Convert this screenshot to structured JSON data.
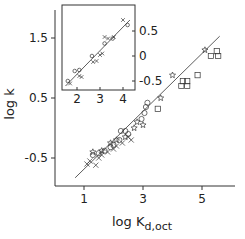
{
  "chart_data": [
    {
      "name": "main",
      "type": "scatter",
      "title": "",
      "xlabel": "log K",
      "xlabel_sub": "d,oct",
      "ylabel": "log k",
      "xlim": [
        0,
        6
      ],
      "ylim": [
        -1.0,
        2.0
      ],
      "xticks": [
        1,
        3,
        5
      ],
      "xtick_labels": [
        "1",
        "3",
        "5"
      ],
      "yticks": [
        1.5,
        0.5,
        -0.5
      ],
      "ytick_labels": [
        "1.5",
        "0.5",
        "-0.5"
      ],
      "grid": false,
      "fit_line": {
        "x": [
          0.7,
          5.6
        ],
        "y": [
          -0.83,
          1.53
        ]
      },
      "series": [
        {
          "name": "circles",
          "marker": "circle",
          "points": [
            [
              1.3,
              -0.45
            ],
            [
              1.5,
              -0.42
            ],
            [
              1.7,
              -0.38
            ],
            [
              1.9,
              -0.32
            ],
            [
              2.0,
              -0.28
            ],
            [
              2.2,
              -0.2
            ],
            [
              2.25,
              -0.05
            ],
            [
              2.4,
              -0.05
            ],
            [
              2.5,
              -0.1
            ],
            [
              2.95,
              0.15
            ],
            [
              3.05,
              0.25
            ],
            [
              3.1,
              0.35
            ],
            [
              3.15,
              0.42
            ]
          ]
        },
        {
          "name": "crosses",
          "marker": "cross",
          "points": [
            [
              1.1,
              -0.6
            ],
            [
              1.2,
              -0.55
            ],
            [
              1.4,
              -0.62
            ],
            [
              1.5,
              -0.5
            ],
            [
              1.6,
              -0.45
            ],
            [
              1.8,
              -0.4
            ],
            [
              2.0,
              -0.35
            ],
            [
              2.1,
              -0.3
            ],
            [
              2.3,
              -0.25
            ],
            [
              2.5,
              -0.15
            ],
            [
              2.6,
              -0.2
            ]
          ]
        },
        {
          "name": "stars",
          "marker": "star",
          "points": [
            [
              1.3,
              -0.4
            ],
            [
              1.6,
              -0.38
            ],
            [
              1.9,
              -0.25
            ],
            [
              2.1,
              -0.2
            ],
            [
              2.4,
              -0.15
            ],
            [
              2.7,
              0.0
            ],
            [
              2.8,
              0.1
            ],
            [
              3.0,
              0.05
            ],
            [
              3.6,
              0.5
            ],
            [
              4.0,
              0.88
            ],
            [
              5.1,
              1.3
            ]
          ]
        },
        {
          "name": "squares",
          "marker": "square",
          "points": [
            [
              3.5,
              0.32
            ],
            [
              4.3,
              0.7
            ],
            [
              4.35,
              0.78
            ],
            [
              4.5,
              0.78
            ],
            [
              4.5,
              0.7
            ],
            [
              4.85,
              0.88
            ],
            [
              5.3,
              1.2
            ],
            [
              5.5,
              1.28
            ],
            [
              5.55,
              1.2
            ]
          ]
        }
      ]
    },
    {
      "name": "inset",
      "type": "scatter",
      "xlim": [
        1.35,
        4.5
      ],
      "ylim": [
        -0.7,
        1.0
      ],
      "xticks": [
        2,
        3,
        4
      ],
      "xtick_labels": [
        "2",
        "3",
        "4"
      ],
      "yticks": [
        0.5,
        0,
        -0.5
      ],
      "ytick_labels": [
        "0.5",
        "0",
        "-0.5"
      ],
      "yaxis_position": "right",
      "grid": false,
      "fit_line": {
        "x": [
          1.5,
          4.3
        ],
        "y": [
          -0.6,
          0.72
        ]
      },
      "series": [
        {
          "name": "circles",
          "marker": "circle",
          "points": [
            [
              1.6,
              -0.5
            ],
            [
              1.9,
              -0.3
            ],
            [
              2.1,
              -0.28
            ],
            [
              2.65,
              0.0
            ],
            [
              3.2,
              0.25
            ],
            [
              3.55,
              0.35
            ],
            [
              4.2,
              0.62
            ]
          ]
        },
        {
          "name": "crosses",
          "marker": "cross",
          "points": [
            [
              1.7,
              -0.55
            ],
            [
              2.1,
              -0.4
            ],
            [
              2.2,
              -0.42
            ],
            [
              2.7,
              -0.12
            ],
            [
              2.85,
              -0.1
            ],
            [
              3.0,
              0.02
            ],
            [
              3.1,
              0.05
            ],
            [
              3.2,
              0.38
            ],
            [
              3.35,
              0.35
            ],
            [
              3.6,
              0.38
            ],
            [
              4.0,
              0.72
            ]
          ]
        }
      ]
    }
  ]
}
